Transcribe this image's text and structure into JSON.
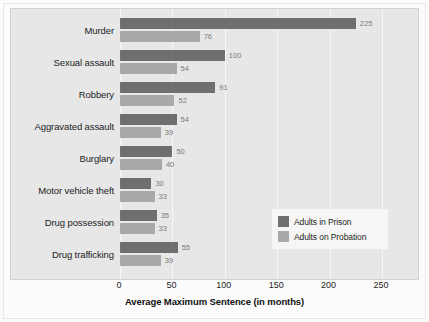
{
  "chart_data": {
    "type": "bar",
    "orientation": "horizontal",
    "title": "",
    "xlabel": "Average Maximum Sentence (in months)",
    "ylabel": "",
    "xlim": [
      0,
      265
    ],
    "xticks": [
      0,
      50,
      100,
      150,
      200,
      250
    ],
    "xtick_labels": [
      "0",
      "50",
      "100",
      "150",
      "200",
      "250"
    ],
    "grid": true,
    "grid_axis": "x",
    "legend_position": "center-right",
    "categories": [
      "Murder",
      "Sexual assault",
      "Robbery",
      "Aggravated assault",
      "Burglary",
      "Motor vehicle theft",
      "Drug possession",
      "Drug trafficking"
    ],
    "series": [
      {
        "name": "Adults in Prison",
        "color": "#6f6f6f",
        "values": [
          225,
          100,
          91,
          54,
          50,
          30,
          35,
          55
        ]
      },
      {
        "name": "Adults on Probation",
        "color": "#a9a9a9",
        "values": [
          76,
          54,
          52,
          39,
          40,
          33,
          33,
          39
        ]
      }
    ],
    "value_labels": {
      "prison": [
        "225",
        "100",
        "91",
        "54",
        "50",
        "30",
        "35",
        "55"
      ],
      "probation": [
        "76",
        "54",
        "52",
        "39",
        "40",
        "33",
        "33",
        "39"
      ]
    }
  },
  "legend": {
    "items": [
      {
        "label": "Adults in Prison",
        "color": "#6f6f6f"
      },
      {
        "label": "Adults on Probation",
        "color": "#a9a9a9"
      }
    ]
  },
  "axis": {
    "title": "Average Maximum Sentence (in months)"
  },
  "colors": {
    "prison": "#6f6f6f",
    "probation": "#a9a9a9",
    "plot_background": "#e7e7e7",
    "figure_background": "#fbfbfb",
    "gridline": "#f7f7f7",
    "value_label": "#7a7a7a"
  }
}
